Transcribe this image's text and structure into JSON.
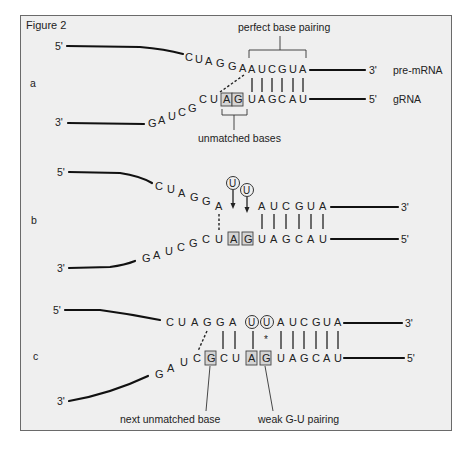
{
  "figure": {
    "title": "Figure 2",
    "panels": [
      {
        "id": "a",
        "label": "a",
        "top_strand": {
          "name": "pre-mRNA",
          "end5": "5'",
          "end3": "3'",
          "loop_seq": [
            "C",
            "U",
            "A",
            "G",
            "G",
            "A"
          ],
          "paired_seq": [
            "A",
            "U",
            "C",
            "G",
            "U",
            "A"
          ]
        },
        "bottom_strand": {
          "name": "gRNA",
          "end5": "5'",
          "end3": "3'",
          "loop_seq": [
            "G",
            "A",
            "U",
            "C",
            "G",
            "C",
            "U"
          ],
          "unmatched": [
            "A",
            "G"
          ],
          "paired_seq": [
            "U",
            "A",
            "G",
            "C",
            "A",
            "U"
          ]
        },
        "annotations": {
          "top": "perfect base pairing",
          "bottom": "unmatched bases"
        }
      },
      {
        "id": "b",
        "label": "b",
        "top_strand": {
          "end5": "5'",
          "end3": "3'",
          "loop_seq": [
            "C",
            "U",
            "A",
            "G",
            "G",
            "A"
          ],
          "paired_seq": [
            "A",
            "U",
            "C",
            "G",
            "U",
            "A"
          ]
        },
        "bottom_strand": {
          "end5": "5'",
          "end3": "3'",
          "loop_seq": [
            "G",
            "A",
            "U",
            "C",
            "G",
            "C",
            "U"
          ],
          "unmatched": [
            "A",
            "G"
          ],
          "paired_seq": [
            "U",
            "A",
            "G",
            "C",
            "A",
            "U"
          ]
        },
        "inserted": [
          "U",
          "U"
        ]
      },
      {
        "id": "c",
        "label": "c",
        "top_strand": {
          "end5": "5'",
          "end3": "3'",
          "seq": [
            "C",
            "U",
            "A",
            "G",
            "G",
            "A",
            "U",
            "U",
            "A",
            "U",
            "C",
            "G",
            "U",
            "A"
          ]
        },
        "bottom_strand": {
          "end5": "5'",
          "end3": "3'",
          "seq": [
            "G",
            "A",
            "U",
            "C",
            "G",
            "C",
            "U",
            "A",
            "G",
            "U",
            "A",
            "G",
            "C",
            "A",
            "U"
          ]
        },
        "weak_pair_marker": "*",
        "annotations": {
          "left": "next unmatched base",
          "right": "weak G-U pairing"
        }
      }
    ]
  }
}
